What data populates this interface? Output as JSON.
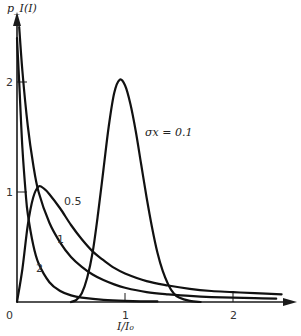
{
  "chart_data": {
    "type": "line",
    "title": "",
    "xlabel": "I/I₀",
    "ylabel": "p_I(I)",
    "xlim": [
      0,
      2.5
    ],
    "ylim": [
      0,
      2.5
    ],
    "grid": false,
    "legend": "inline curve labels",
    "x_ticks": [
      {
        "value": 0,
        "label": "0"
      },
      {
        "value": 1,
        "label": "1"
      },
      {
        "value": 2,
        "label": "2"
      }
    ],
    "y_ticks": [
      {
        "value": 1,
        "label": "1"
      },
      {
        "value": 2,
        "label": "2"
      }
    ],
    "series": [
      {
        "name": "σx = 0.1",
        "label": "σx = 0.1",
        "points": [
          [
            0.5,
            0.0
          ],
          [
            0.55,
            0.02
          ],
          [
            0.6,
            0.08
          ],
          [
            0.65,
            0.22
          ],
          [
            0.7,
            0.45
          ],
          [
            0.75,
            0.8
          ],
          [
            0.8,
            1.2
          ],
          [
            0.85,
            1.6
          ],
          [
            0.9,
            1.9
          ],
          [
            0.95,
            2.02
          ],
          [
            1.0,
            1.97
          ],
          [
            1.05,
            1.8
          ],
          [
            1.1,
            1.55
          ],
          [
            1.15,
            1.25
          ],
          [
            1.2,
            0.95
          ],
          [
            1.25,
            0.68
          ],
          [
            1.3,
            0.45
          ],
          [
            1.35,
            0.28
          ],
          [
            1.4,
            0.16
          ],
          [
            1.45,
            0.08
          ],
          [
            1.5,
            0.04
          ],
          [
            1.6,
            0.01
          ],
          [
            1.7,
            0.0
          ]
        ]
      },
      {
        "name": "σx = 0.5",
        "label": "0.5",
        "points": [
          [
            0.0,
            0.0
          ],
          [
            0.05,
            0.3
          ],
          [
            0.1,
            0.7
          ],
          [
            0.15,
            0.95
          ],
          [
            0.2,
            1.05
          ],
          [
            0.25,
            1.03
          ],
          [
            0.3,
            0.98
          ],
          [
            0.4,
            0.85
          ],
          [
            0.5,
            0.7
          ],
          [
            0.6,
            0.57
          ],
          [
            0.7,
            0.46
          ],
          [
            0.8,
            0.38
          ],
          [
            0.9,
            0.31
          ],
          [
            1.0,
            0.26
          ],
          [
            1.2,
            0.19
          ],
          [
            1.4,
            0.15
          ],
          [
            1.6,
            0.12
          ],
          [
            1.8,
            0.1
          ],
          [
            2.0,
            0.09
          ],
          [
            2.2,
            0.08
          ],
          [
            2.45,
            0.07
          ]
        ]
      },
      {
        "name": "σx = 1",
        "label": "1",
        "points": [
          [
            0.02,
            2.5
          ],
          [
            0.05,
            2.1
          ],
          [
            0.1,
            1.6
          ],
          [
            0.15,
            1.25
          ],
          [
            0.2,
            1.0
          ],
          [
            0.3,
            0.72
          ],
          [
            0.4,
            0.54
          ],
          [
            0.5,
            0.41
          ],
          [
            0.6,
            0.32
          ],
          [
            0.7,
            0.25
          ],
          [
            0.8,
            0.2
          ],
          [
            0.9,
            0.16
          ],
          [
            1.0,
            0.13
          ],
          [
            1.2,
            0.09
          ],
          [
            1.4,
            0.07
          ],
          [
            1.6,
            0.055
          ],
          [
            1.8,
            0.045
          ],
          [
            2.0,
            0.04
          ],
          [
            2.2,
            0.035
          ],
          [
            2.4,
            0.03
          ]
        ]
      },
      {
        "name": "σx = 2",
        "label": "2",
        "points": [
          [
            0.0,
            2.4
          ],
          [
            0.02,
            2.0
          ],
          [
            0.05,
            1.4
          ],
          [
            0.08,
            1.0
          ],
          [
            0.1,
            0.8
          ],
          [
            0.15,
            0.52
          ],
          [
            0.2,
            0.35
          ],
          [
            0.3,
            0.18
          ],
          [
            0.4,
            0.1
          ],
          [
            0.5,
            0.06
          ],
          [
            0.6,
            0.04
          ],
          [
            0.8,
            0.02
          ],
          [
            1.0,
            0.01
          ],
          [
            1.3,
            0.005
          ]
        ]
      }
    ]
  }
}
